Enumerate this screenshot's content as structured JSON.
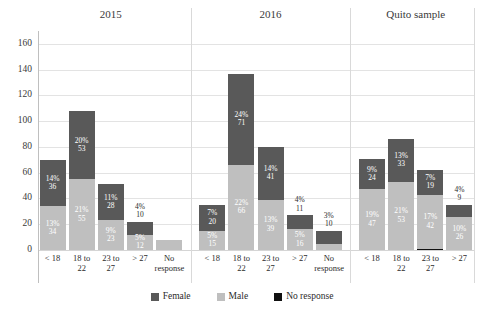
{
  "chart_data": {
    "type": "bar",
    "title": "",
    "subtitle": "",
    "xlabel": "",
    "ylabel": "",
    "ylim": [
      0,
      170
    ],
    "yticks": [
      0,
      20,
      40,
      60,
      80,
      100,
      120,
      140,
      160
    ],
    "grid": true,
    "stacked": true,
    "legend_position": "bottom",
    "legend": [
      "Female",
      "Male",
      "No response"
    ],
    "colors": {
      "Female": "#595959",
      "Male": "#bfbfbf",
      "No response": "#111111",
      "grid": "#e3e3e3",
      "axis": "#bfbfbf",
      "text": "#2b2b2b"
    },
    "groups": [
      {
        "name": "2015",
        "categories": [
          "< 18",
          "18 to 22",
          "23 to 27",
          "> 27",
          "No response"
        ],
        "bars": [
          {
            "category": "< 18",
            "total": 70,
            "segments": [
              {
                "series": "No response",
                "value": 0,
                "pct": "",
                "label_inside": false
              },
              {
                "series": "Male",
                "value": 34,
                "pct": "13%",
                "label_inside": true
              },
              {
                "series": "Female",
                "value": 36,
                "pct": "14%",
                "label_inside": true
              }
            ]
          },
          {
            "category": "18 to 22",
            "total": 108,
            "segments": [
              {
                "series": "No response",
                "value": 0,
                "pct": "",
                "label_inside": false
              },
              {
                "series": "Male",
                "value": 55,
                "pct": "21%",
                "label_inside": true
              },
              {
                "series": "Female",
                "value": 53,
                "pct": "20%",
                "label_inside": true
              }
            ]
          },
          {
            "category": "23 to 27",
            "total": 51,
            "segments": [
              {
                "series": "No response",
                "value": 0,
                "pct": "",
                "label_inside": false
              },
              {
                "series": "Male",
                "value": 23,
                "pct": "9%",
                "label_inside": true
              },
              {
                "series": "Female",
                "value": 28,
                "pct": "11%",
                "label_inside": true
              }
            ]
          },
          {
            "category": "> 27",
            "total": 22,
            "segments": [
              {
                "series": "No response",
                "value": 0,
                "pct": "",
                "label_inside": false
              },
              {
                "series": "Male",
                "value": 12,
                "pct": "5%",
                "label_inside": true
              },
              {
                "series": "Female",
                "value": 10,
                "pct": "4%",
                "label_inside": false
              }
            ]
          },
          {
            "category": "No response",
            "total": 8,
            "segments": [
              {
                "series": "No response",
                "value": 0,
                "pct": "",
                "label_inside": false
              },
              {
                "series": "Male",
                "value": 8,
                "pct": "",
                "label_inside": false
              },
              {
                "series": "Female",
                "value": 0,
                "pct": "",
                "label_inside": false
              }
            ]
          }
        ]
      },
      {
        "name": "2016",
        "categories": [
          "< 18",
          "18 to 22",
          "23 to 27",
          "> 27",
          "No response"
        ],
        "bars": [
          {
            "category": "< 18",
            "total": 35,
            "segments": [
              {
                "series": "No response",
                "value": 0,
                "pct": "",
                "label_inside": false
              },
              {
                "series": "Male",
                "value": 15,
                "pct": "5%",
                "label_inside": true
              },
              {
                "series": "Female",
                "value": 20,
                "pct": "7%",
                "label_inside": true
              }
            ]
          },
          {
            "category": "18 to 22",
            "total": 137,
            "segments": [
              {
                "series": "No response",
                "value": 0,
                "pct": "",
                "label_inside": false
              },
              {
                "series": "Male",
                "value": 66,
                "pct": "22%",
                "label_inside": true
              },
              {
                "series": "Female",
                "value": 71,
                "pct": "24%",
                "label_inside": true
              }
            ]
          },
          {
            "category": "23 to 27",
            "total": 80,
            "segments": [
              {
                "series": "No response",
                "value": 0,
                "pct": "",
                "label_inside": false
              },
              {
                "series": "Male",
                "value": 39,
                "pct": "13%",
                "label_inside": true
              },
              {
                "series": "Female",
                "value": 41,
                "pct": "14%",
                "label_inside": true
              }
            ]
          },
          {
            "category": "> 27",
            "total": 27,
            "segments": [
              {
                "series": "No response",
                "value": 0,
                "pct": "",
                "label_inside": false
              },
              {
                "series": "Male",
                "value": 16,
                "pct": "5%",
                "label_inside": true
              },
              {
                "series": "Female",
                "value": 11,
                "pct": "4%",
                "label_inside": false
              }
            ]
          },
          {
            "category": "No response",
            "total": 15,
            "segments": [
              {
                "series": "No response",
                "value": 0,
                "pct": "",
                "label_inside": false
              },
              {
                "series": "Male",
                "value": 5,
                "pct": "",
                "label_inside": false
              },
              {
                "series": "Female",
                "value": 10,
                "pct": "3%",
                "label_inside": false
              }
            ]
          }
        ]
      },
      {
        "name": "Quito sample",
        "categories": [
          "< 18",
          "18 to 22",
          "23 to 27",
          "> 27"
        ],
        "bars": [
          {
            "category": "< 18",
            "total": 71,
            "segments": [
              {
                "series": "No response",
                "value": 0,
                "pct": "",
                "label_inside": false
              },
              {
                "series": "Male",
                "value": 47,
                "pct": "19%",
                "label_inside": true
              },
              {
                "series": "Female",
                "value": 24,
                "pct": "9%",
                "label_inside": true
              }
            ]
          },
          {
            "category": "18 to 22",
            "total": 86,
            "segments": [
              {
                "series": "No response",
                "value": 0,
                "pct": "",
                "label_inside": false
              },
              {
                "series": "Male",
                "value": 53,
                "pct": "21%",
                "label_inside": true
              },
              {
                "series": "Female",
                "value": 33,
                "pct": "13%",
                "label_inside": true
              }
            ]
          },
          {
            "category": "23 to 27",
            "total": 62,
            "segments": [
              {
                "series": "No response",
                "value": 1,
                "pct": "",
                "label_inside": false
              },
              {
                "series": "Male",
                "value": 42,
                "pct": "17%",
                "label_inside": true
              },
              {
                "series": "Female",
                "value": 19,
                "pct": "7%",
                "label_inside": true
              }
            ]
          },
          {
            "category": "> 27",
            "total": 35,
            "segments": [
              {
                "series": "No response",
                "value": 0,
                "pct": "",
                "label_inside": false
              },
              {
                "series": "Male",
                "value": 26,
                "pct": "10%",
                "label_inside": true
              },
              {
                "series": "Female",
                "value": 9,
                "pct": "4%",
                "label_inside": false
              }
            ]
          }
        ]
      }
    ]
  }
}
